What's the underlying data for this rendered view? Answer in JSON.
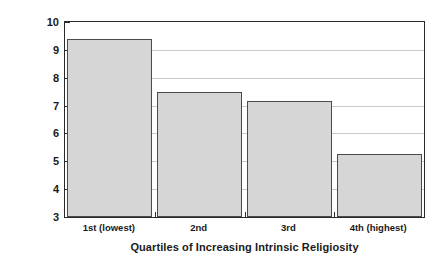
{
  "chart_data": {
    "type": "bar",
    "title": "",
    "subtitle": "",
    "xlabel": "Quartiles of Increasing Intrinsic Religiosity",
    "ylabel": "Average Number of Hospital Days",
    "categories": [
      "1st (lowest)",
      "2nd",
      "3rd",
      "4th (highest)"
    ],
    "values": [
      9.4,
      7.5,
      7.15,
      5.25
    ],
    "ylim": [
      3,
      10
    ],
    "yticks": [
      3,
      4,
      5,
      6,
      7,
      8,
      9,
      10
    ],
    "ytick_labels": [
      "3",
      "4",
      "5",
      "6",
      "7",
      "8",
      "9",
      "10"
    ],
    "grid": true,
    "grid_axis": "y",
    "legend": false,
    "legend_position": "none",
    "bar_fill_color": "#d6d6d6",
    "bar_edge_color": "#4a4a4a",
    "gridline_color": "#c9c9c9",
    "axis_color": "#2b2b2b",
    "background_color": "#ffffff"
  }
}
